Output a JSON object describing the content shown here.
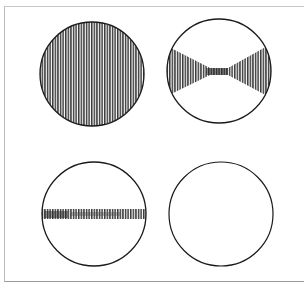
{
  "figure": {
    "panels": [
      {
        "id": "full",
        "pattern": "vertical-hatch-full",
        "cx": 92,
        "cy": 74,
        "r": 52
      },
      {
        "id": "bowtie",
        "pattern": "vertical-hatch-bowtie",
        "cx": 219,
        "cy": 71,
        "r": 52
      },
      {
        "id": "band",
        "pattern": "vertical-hatch-horizontal-band",
        "cx": 94,
        "cy": 214,
        "r": 52
      },
      {
        "id": "empty",
        "pattern": "none",
        "cx": 221,
        "cy": 214,
        "r": 52
      }
    ],
    "colors": {
      "stroke": "#1a1a1a",
      "hatch": "#333333",
      "background": "#ffffff"
    }
  }
}
